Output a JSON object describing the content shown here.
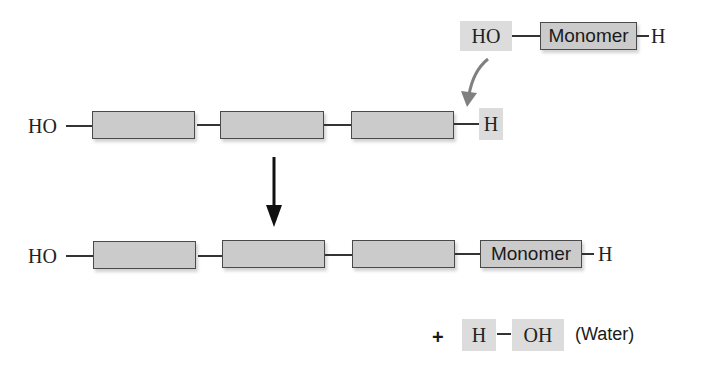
{
  "diagram": {
    "type": "dehydration-synthesis",
    "incoming_monomer": {
      "left_group": "HO",
      "label": "Monomer",
      "right_group": "H"
    },
    "polymer_before": {
      "left_group": "HO",
      "right_group": "H",
      "unit_count": 3
    },
    "polymer_after": {
      "left_group": "HO",
      "new_unit_label": "Monomer",
      "right_group": "H",
      "unit_count": 4
    },
    "byproduct": {
      "plus": "+",
      "h": "H",
      "oh": "OH",
      "label": "(Water)"
    },
    "colors": {
      "box_fill": "#cbcbcb",
      "highlight_fill": "#dcdcdc",
      "curved_arrow": "#808080",
      "down_arrow": "#111111"
    }
  }
}
